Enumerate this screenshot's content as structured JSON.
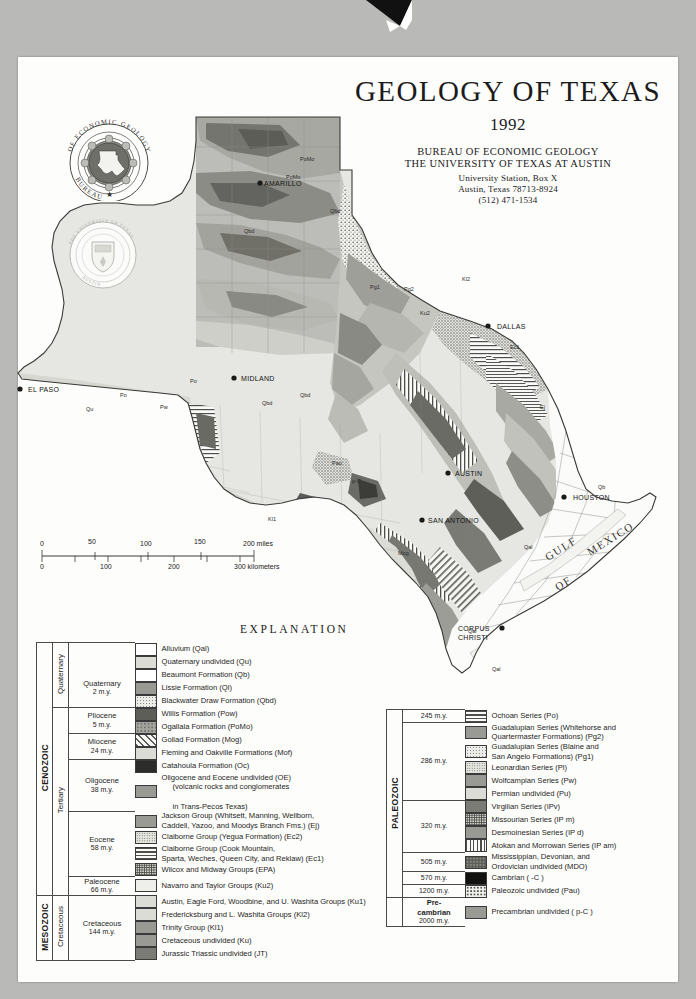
{
  "title": {
    "main": "GEOLOGY OF TEXAS",
    "year": "1992",
    "org_line1": "BUREAU OF ECONOMIC GEOLOGY",
    "org_line2": "THE UNIVERSITY OF TEXAS AT AUSTIN",
    "address_line1": "University Station, Box X",
    "address_line2": "Austin, Texas 78713-8924",
    "phone": "(512) 471-1534"
  },
  "seals": {
    "beg": "bureau-of-economic-geology-seal",
    "beg_text": "BUREAU OF ECONOMIC GEOLOGY",
    "ut": "university-of-texas-seal"
  },
  "scale": {
    "miles": [
      "0",
      "50",
      "100",
      "150",
      "200 miles"
    ],
    "kilometers": [
      "0",
      "100",
      "200",
      "300 kilometers"
    ]
  },
  "explanation_heading": "EXPLANATION",
  "map": {
    "cities": [
      {
        "name": "AMARILLO",
        "x": 264,
        "y": 133
      },
      {
        "name": "EL PASO",
        "x": 28,
        "y": 339
      },
      {
        "name": "MIDLAND",
        "x": 241,
        "y": 328
      },
      {
        "name": "DALLAS",
        "x": 497,
        "y": 276
      },
      {
        "name": "AUSTIN",
        "x": 455,
        "y": 423
      },
      {
        "name": "SAN ANTONIO",
        "x": 428,
        "y": 470
      },
      {
        "name": "HOUSTON",
        "x": 573,
        "y": 447
      },
      {
        "name": "CORPUS",
        "x": 458,
        "y": 578
      },
      {
        "name": "CHRISTI",
        "x": 458,
        "y": 587
      }
    ],
    "water_labels": [
      {
        "name": "GULF",
        "x": 548,
        "y": 508
      },
      {
        "name": "OF",
        "x": 558,
        "y": 538
      },
      {
        "name": "MEXICO",
        "x": 590,
        "y": 503
      }
    ],
    "unit_labels": [
      "Qal",
      "Qu",
      "Qb",
      "Qbd",
      "Po",
      "Pw",
      "Ec1",
      "Mog",
      "PoMo",
      "Ku",
      "Pg2",
      "Pl",
      "p-C",
      "Pau"
    ]
  },
  "legend_cenozoic": {
    "eras": [
      {
        "name": "CENOZOIC",
        "rows": 18
      },
      {
        "name": "MESOZOIC",
        "rows": 6
      }
    ],
    "systems": [
      "Quaternary",
      "Tertiary",
      "Cretaceous",
      "Jurassic Triassic"
    ],
    "epochs": [
      {
        "label": "Quaternary",
        "boundary": "2 m.y."
      },
      {
        "label": "Pliocene",
        "boundary": "5 m.y."
      },
      {
        "label": "Miocene",
        "boundary": "24 m.y."
      },
      {
        "label": "Oligocene",
        "boundary": "38 m.y."
      },
      {
        "label": "Eocene",
        "boundary": "58 m.y."
      },
      {
        "label": "Paleocene",
        "boundary": "66 m.y."
      },
      {
        "label": "Cretaceous",
        "boundary": "144 m.y."
      },
      {
        "label": "Jurassic Triassic",
        "boundary": "245 m.y."
      }
    ],
    "units": [
      {
        "label": "Alluvium (Qal)",
        "pattern": "white"
      },
      {
        "label": "Quaternary undivided (Qu)",
        "pattern": "light-gray"
      },
      {
        "label": "Beaumont Formation (Qb)",
        "pattern": "white"
      },
      {
        "label": "Lissie Formation (Ql)",
        "pattern": "mid-gray"
      },
      {
        "label": "Blackwater Draw Formation (Qbd)",
        "pattern": "pale-stipple"
      },
      {
        "label": "Willis Formation (Pow)",
        "pattern": "dark-gray"
      },
      {
        "label": "Ogallala Formation (PoMo)",
        "pattern": "mottled-gray"
      },
      {
        "label": "Goliad Formation (Mog)",
        "pattern": "diagonal-hatch"
      },
      {
        "label": "Fleming and Oakville Formations (Mof)",
        "pattern": "light-gray"
      },
      {
        "label": "Catahoula Formation (Oc)",
        "pattern": "near-black"
      },
      {
        "label": "Oligocene and Eocene undivided (OE)",
        "pattern": "mid-gray",
        "sub1": "(volcanic rocks and conglomerates",
        "sub2": "in Trans-Pecos Texas)"
      },
      {
        "label": "Jackson Group (Whitsett, Manning, Wellborn,",
        "pattern": "mid-gray",
        "sub1": "Caddell, Yazoo, and Moodys Branch Fms.) (Ej)"
      },
      {
        "label": "Claiborne Group (Yegua Formation) (Ec2)",
        "pattern": "fine-stipple"
      },
      {
        "label": "Claiborne Group (Cook Mountain,",
        "pattern": "horizontal-lines",
        "sub1": "Sparta, Weches, Queen City, and Reklaw) (Ec1)"
      },
      {
        "label": "Wilcox and Midway Groups (EPA)",
        "pattern": "dense-stipple"
      },
      {
        "label": "Navarro and Taylor Groups (Ku2)",
        "pattern": "very-light-gray"
      },
      {
        "label": "Austin, Eagle Ford, Woodbine, and U. Washita Groups (Ku1)",
        "pattern": "light-gray"
      },
      {
        "label": "Fredericksburg and L. Washita Groups (Kl2)",
        "pattern": "light-gray"
      },
      {
        "label": "Trinity Group (Kl1)",
        "pattern": "mid-gray"
      },
      {
        "label": "Cretaceous undivided (Ku)",
        "pattern": "mid-gray"
      },
      {
        "label": "Jurassic Triassic undivided (JT)",
        "pattern": "mid-dark-gray"
      }
    ]
  },
  "legend_paleozoic": {
    "era": "PALEOZOIC",
    "era_precambrian": "Pre-cambrian",
    "boundaries": [
      "245 m.y.",
      "286 m.y.",
      "320 m.y.",
      "505 m.y.",
      "570 m.y.",
      "1200 m.y.",
      "2000 m.y."
    ],
    "units": [
      {
        "label": "Ochoan Series (Po)",
        "pattern": "horizontal-lines"
      },
      {
        "label": "Guadalupian Series (Whitehorse and",
        "pattern": "mid-gray",
        "sub1": "Quartermaster Formations) (Pg2)"
      },
      {
        "label": "Guadalupian Series (Blaine and",
        "pattern": "pale-stipple",
        "sub1": "San Angelo Formations) (Pg1)"
      },
      {
        "label": "Leonardian Series (Pl)",
        "pattern": "fine-stipple"
      },
      {
        "label": "Wolfcampian Series (Pw)",
        "pattern": "mid-gray"
      },
      {
        "label": "Permian undivided (Pu)",
        "pattern": "light-gray"
      },
      {
        "label": "Virgilian Series (IPv)",
        "pattern": "mid-dark-gray"
      },
      {
        "label": "Missourian Series (IP m)",
        "pattern": "dense-stipple"
      },
      {
        "label": "Desmoinesian Series (IP d)",
        "pattern": "mid-gray"
      },
      {
        "label": "Atokan and Morrowan Series (IP am)",
        "pattern": "vertical-lines"
      },
      {
        "label": "Mississippian, Devonian, and",
        "pattern": "dark-mottle",
        "sub1": "Ordovician undivided (MDO)"
      },
      {
        "label": "Cambrian ( -C )",
        "pattern": "black"
      },
      {
        "label": "Paleozoic undivided (Pau)",
        "pattern": "coarse-stipple"
      },
      {
        "label": "Precambrian undivided ( p-C )",
        "pattern": "mid-gray"
      }
    ]
  }
}
